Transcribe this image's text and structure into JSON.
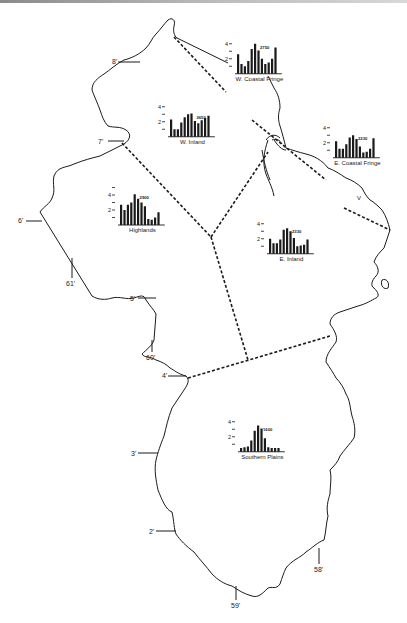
{
  "map": {
    "background": "#ffffff",
    "line_color": "#1a1a1a",
    "coordinate_labels": {
      "lat_8": "8'",
      "lat_7": "7'",
      "lat_6": "6'",
      "lat_5": "5'",
      "lat_4": "4'",
      "lat_3": "3'",
      "lat_2": "2'",
      "lon_61": "61'",
      "lon_60": "60'",
      "lon_59": "59'",
      "lon_58": "58'"
    },
    "region_marker": "V"
  },
  "chart_data": [
    {
      "type": "bar",
      "title": "W. Coastal Fringe",
      "annotation": "2750",
      "categories": [
        "1",
        "2",
        "3",
        "4",
        "5",
        "6",
        "7",
        "8",
        "9",
        "10",
        "11",
        "12"
      ],
      "values": [
        2.6,
        1.3,
        1.0,
        1.7,
        3.3,
        4.0,
        3.1,
        2.0,
        1.3,
        1.5,
        2.0,
        3.5
      ],
      "yticks": [
        "4",
        "",
        "2",
        ""
      ],
      "ylim": [
        0,
        4.5
      ]
    },
    {
      "type": "bar",
      "title": "W. Inland",
      "annotation": "2650",
      "categories": [
        "1",
        "2",
        "3",
        "4",
        "5",
        "6",
        "7",
        "8",
        "9",
        "10",
        "11",
        "12"
      ],
      "values": [
        2.3,
        1.0,
        1.0,
        1.9,
        2.6,
        3.0,
        3.1,
        2.1,
        1.8,
        2.2,
        2.5,
        2.8
      ],
      "yticks": [
        "4",
        "",
        "2",
        ""
      ],
      "ylim": [
        0,
        4.5
      ]
    },
    {
      "type": "bar",
      "title": "E. Coastal Fringe",
      "annotation": "2230",
      "categories": [
        "1",
        "2",
        "3",
        "4",
        "5",
        "6",
        "7",
        "8",
        "9",
        "10",
        "11",
        "12"
      ],
      "values": [
        2.2,
        1.2,
        1.2,
        1.8,
        2.7,
        3.0,
        2.5,
        1.5,
        0.7,
        0.8,
        1.2,
        2.6
      ],
      "yticks": [
        "4",
        "",
        "2",
        ""
      ],
      "ylim": [
        0,
        4.5
      ]
    },
    {
      "type": "bar",
      "title": "Highlands",
      "annotation": "2900",
      "categories": [
        "1",
        "2",
        "3",
        "4",
        "5",
        "6",
        "7",
        "8",
        "9",
        "10",
        "11",
        "12"
      ],
      "values": [
        2.7,
        2.0,
        2.7,
        3.0,
        4.1,
        3.5,
        3.0,
        2.5,
        0.8,
        0.7,
        1.0,
        1.7
      ],
      "yticks": [
        "",
        "4",
        "",
        "2",
        ""
      ],
      "ylim": [
        0,
        5.2
      ]
    },
    {
      "type": "bar",
      "title": "E. Inland",
      "annotation": "2330",
      "categories": [
        "1",
        "2",
        "3",
        "4",
        "5",
        "6",
        "7",
        "8",
        "9",
        "10",
        "11",
        "12"
      ],
      "values": [
        2.0,
        1.4,
        1.4,
        1.9,
        3.2,
        3.4,
        3.0,
        2.1,
        1.0,
        1.1,
        1.2,
        1.9
      ],
      "yticks": [
        "4",
        "",
        "2",
        ""
      ],
      "ylim": [
        0,
        4.5
      ]
    },
    {
      "type": "bar",
      "title": "Southern Plains",
      "annotation": "1600",
      "categories": [
        "1",
        "2",
        "3",
        "4",
        "5",
        "6",
        "7",
        "8",
        "9",
        "10",
        "11",
        "12"
      ],
      "values": [
        0.5,
        0.6,
        0.7,
        1.5,
        2.8,
        3.5,
        3.1,
        1.8,
        0.6,
        0.5,
        0.5,
        0.5
      ],
      "yticks": [
        "4",
        "",
        "2",
        ""
      ],
      "ylim": [
        0,
        4.5
      ]
    }
  ]
}
